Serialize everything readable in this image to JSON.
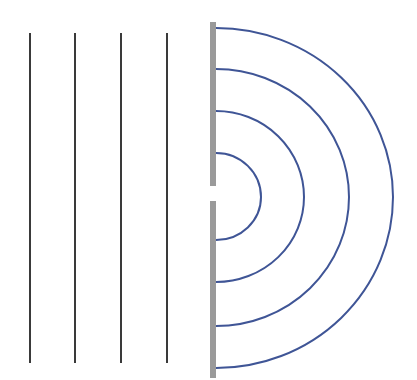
{
  "diagram": {
    "colors": {
      "background": "#ffffff",
      "incident_wave": "#3a3a3a",
      "barrier": "#9a9a9a",
      "diffracted_wave": "#3f5596"
    },
    "incident_wavefronts": [
      {
        "x": 30,
        "y1": 33,
        "y2": 363
      },
      {
        "x": 75,
        "y1": 33,
        "y2": 363
      },
      {
        "x": 121,
        "y1": 33,
        "y2": 363
      },
      {
        "x": 167,
        "y1": 33,
        "y2": 363
      }
    ],
    "barrier": {
      "x": 210,
      "width": 6,
      "upper": {
        "y1": 22,
        "y2": 186
      },
      "lower": {
        "y1": 201,
        "y2": 378
      }
    },
    "slit": {
      "cx": 216,
      "cy": 197
    },
    "diffracted_wavefronts": [
      {
        "rx": 45,
        "ry_top": 44,
        "ry_bottom": 43
      },
      {
        "rx": 88,
        "ry_top": 86,
        "ry_bottom": 85
      },
      {
        "rx": 133,
        "ry_top": 128,
        "ry_bottom": 129
      },
      {
        "rx": 177,
        "ry_top": 169,
        "ry_bottom": 171
      }
    ]
  }
}
